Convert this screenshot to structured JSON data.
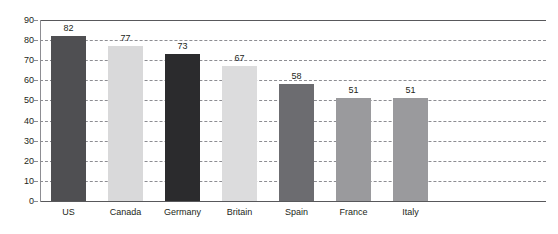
{
  "caption": {
    "clipped_text": " "
  },
  "chart_data": {
    "type": "bar",
    "title": "",
    "subtitle": "",
    "xlabel": "",
    "ylabel": "",
    "categories": [
      "US",
      "Canada",
      "Germany",
      "Britain",
      "Spain",
      "France",
      "Italy"
    ],
    "values": [
      82,
      77,
      73,
      67,
      58,
      51,
      51
    ],
    "value_labels": [
      "82",
      "77",
      "73",
      "67",
      "58",
      "51",
      "51"
    ],
    "series": [
      {
        "name": "",
        "values": [
          82,
          77,
          73,
          67,
          58,
          51,
          51
        ]
      }
    ],
    "bar_colors": [
      "#4f4f52",
      "#d9d9da",
      "#2b2b2d",
      "#dcdcdd",
      "#6c6c70",
      "#9a9a9d",
      "#9a9a9d"
    ],
    "ylim": [
      0,
      90
    ],
    "ytick_values": [
      90,
      80,
      70,
      60,
      50,
      40,
      30,
      20,
      10,
      0
    ],
    "ytick_labels": [
      "90",
      "80",
      "70",
      "60",
      "50",
      "40",
      "30",
      "20",
      "10",
      "0"
    ],
    "grid": "horizontal-dashed",
    "legend": "none",
    "annotations": []
  },
  "colors": {
    "axis": "#8d8d92",
    "rule": "#58585b",
    "grid": "#8d8d92",
    "text": "#231f20",
    "background": "#ffffff"
  }
}
